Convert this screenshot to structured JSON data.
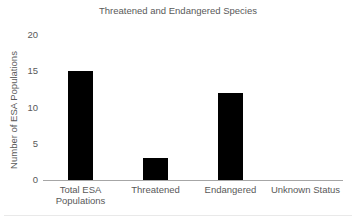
{
  "chart_data": {
    "type": "bar",
    "title": "Threatened and Endangered Species",
    "xlabel": "",
    "ylabel": "Number of ESA Populations",
    "categories": [
      "Total ESA Populations",
      "Threatened",
      "Endangered",
      "Unknown Status"
    ],
    "values": [
      15,
      3,
      12,
      0
    ],
    "ylim": [
      0,
      20
    ],
    "yticks": [
      0,
      5,
      10,
      15,
      20
    ],
    "grid": false,
    "legend": false,
    "bar_color": "#000000",
    "text_color": "#595959",
    "axis_line_color": "#a6a6a6"
  }
}
